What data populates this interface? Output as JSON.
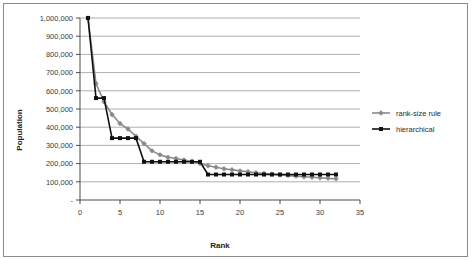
{
  "chart_data": {
    "type": "line",
    "title": "",
    "xlabel": "Rank",
    "ylabel": "Population",
    "xlim": [
      0,
      35
    ],
    "ylim": [
      0,
      1000000
    ],
    "grid": true,
    "legend_position": "right",
    "x_ticks": [
      "0",
      "5",
      "10",
      "15",
      "20",
      "25",
      "30",
      "35"
    ],
    "x_tick_values": [
      0,
      5,
      10,
      15,
      20,
      25,
      30,
      35
    ],
    "y_ticks": [
      "-",
      "100,000",
      "200,000",
      "300,000",
      "400,000",
      "500,000",
      "600,000",
      "700,000",
      "800,000",
      "900,000",
      "1,000,000"
    ],
    "y_tick_values": [
      0,
      100000,
      200000,
      300000,
      400000,
      500000,
      600000,
      700000,
      800000,
      900000,
      1000000
    ],
    "x": [
      1,
      2,
      3,
      4,
      5,
      6,
      7,
      8,
      9,
      10,
      11,
      12,
      13,
      14,
      15,
      16,
      17,
      18,
      19,
      20,
      21,
      22,
      23,
      24,
      25,
      26,
      27,
      28,
      29,
      30,
      31,
      32
    ],
    "series": [
      {
        "name": "rank-size rule",
        "color": "#8a8a8a",
        "marker": "diamond",
        "values": [
          1000000,
          640000,
          540000,
          470000,
          420000,
          390000,
          350000,
          310000,
          270000,
          248000,
          235000,
          228000,
          220000,
          212000,
          200000,
          188000,
          180000,
          172000,
          166000,
          160000,
          155000,
          150000,
          146000,
          142000,
          138000,
          134000,
          131000,
          128000,
          125000,
          122000,
          119000,
          117000
        ]
      },
      {
        "name": "hierarchical",
        "color": "#111111",
        "marker": "square",
        "values": [
          1000000,
          560000,
          560000,
          340000,
          340000,
          340000,
          340000,
          210000,
          210000,
          210000,
          210000,
          210000,
          210000,
          210000,
          210000,
          140000,
          140000,
          140000,
          140000,
          140000,
          140000,
          140000,
          140000,
          140000,
          140000,
          140000,
          140000,
          140000,
          140000,
          140000,
          140000,
          140000
        ]
      }
    ]
  },
  "legend": {
    "items": [
      {
        "label": "rank-size rule"
      },
      {
        "label": "hierarchical"
      }
    ]
  }
}
